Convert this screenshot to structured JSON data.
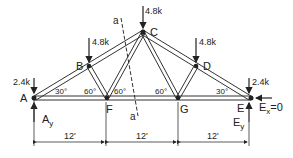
{
  "diagram": {
    "nodes": {
      "A": {
        "label": "A"
      },
      "B": {
        "label": "B"
      },
      "C": {
        "label": "C"
      },
      "D": {
        "label": "D"
      },
      "E": {
        "label": "E"
      },
      "F": {
        "label": "F"
      },
      "G": {
        "label": "G"
      }
    },
    "loads": {
      "A": "2.4k",
      "B": "4.8k",
      "C": "4.8k",
      "D": "4.8k",
      "E": "2.4k"
    },
    "reactions": {
      "Ay": "A",
      "Ay_sub": "y",
      "Ey": "E",
      "Ey_sub": "y",
      "Ex": "E",
      "Ex_sub": "x",
      "Ex_value": "=0"
    },
    "angles": {
      "A": "30°",
      "F_left": "60°",
      "F_right": "60°",
      "G_left": "60°",
      "E": "30°"
    },
    "section": {
      "top": "a",
      "bottom": "a"
    },
    "dimensions": [
      "12'",
      "12'",
      "12'"
    ]
  }
}
